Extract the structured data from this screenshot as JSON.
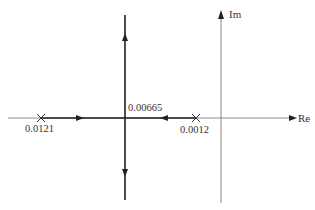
{
  "diagram": {
    "type": "root-locus",
    "axes": {
      "real_label": "Re",
      "imag_label": "Im"
    },
    "poles": [
      {
        "label": "0.0121",
        "marker": "x"
      },
      {
        "label": "0.0012",
        "marker": "x"
      }
    ],
    "breakaway_point": {
      "label": "0.00665"
    },
    "branches": [
      {
        "from": "0.0121",
        "direction": "right",
        "to": "0.00665"
      },
      {
        "from": "0.0012",
        "direction": "left",
        "to": "0.00665"
      },
      {
        "from": "0.00665",
        "direction": "up"
      },
      {
        "from": "0.00665",
        "direction": "down"
      }
    ],
    "colors": {
      "locus": "#222222",
      "axis": "#888888",
      "text": "#333333"
    }
  }
}
